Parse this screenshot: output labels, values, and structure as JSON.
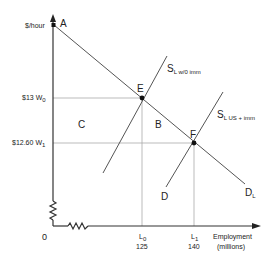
{
  "diagram": {
    "type": "labor-market-supply-demand",
    "y_axis": {
      "label": "$/hour",
      "origin_label": "0"
    },
    "x_axis": {
      "label_line1": "Employment",
      "label_line2": "(millions)"
    },
    "wage_levels": [
      {
        "price": "$13",
        "symbol": "W",
        "sub": "0"
      },
      {
        "price": "$12.60",
        "symbol": "W",
        "sub": "1"
      }
    ],
    "quantity_levels": [
      {
        "symbol": "L",
        "sub": "0",
        "value": "125"
      },
      {
        "symbol": "L",
        "sub": "1",
        "value": "140"
      }
    ],
    "points": {
      "A": "A",
      "E": "E",
      "F": "F"
    },
    "regions": {
      "B": "B",
      "C": "C",
      "D": "D"
    },
    "curves": {
      "supply_without_imm": {
        "symbol": "S",
        "sub": "L w/0 imm"
      },
      "supply_with_imm": {
        "symbol": "S",
        "sub": "L US + imm"
      },
      "demand": {
        "symbol": "D",
        "sub": "L"
      }
    },
    "colors": {
      "axis": "#333333",
      "line": "#555555",
      "guide": "#aaaaaa",
      "point": "#111111"
    }
  }
}
